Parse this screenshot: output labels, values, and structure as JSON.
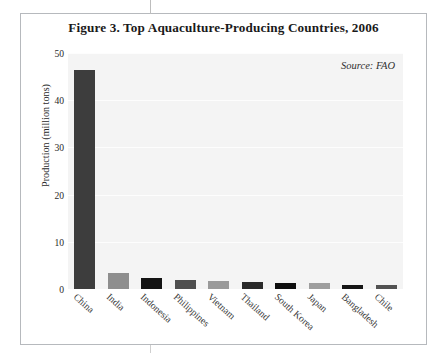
{
  "figure": {
    "title": "Figure 3. Top Aquaculture-Producing Countries, 2006",
    "source_note": "Source: FAO"
  },
  "chart_data": {
    "type": "bar",
    "title": "Figure 3. Top Aquaculture-Producing Countries, 2006",
    "xlabel": "",
    "ylabel": "Production (million tons)",
    "ylim": [
      0,
      50
    ],
    "yticks": [
      0,
      10,
      20,
      30,
      40,
      50
    ],
    "ytick_labels": [
      "0",
      "10",
      "20",
      "30",
      "40",
      "50"
    ],
    "grid": true,
    "legend": false,
    "annotations": [
      "Source: FAO"
    ],
    "categories": [
      "China",
      "India",
      "Indonesia",
      "Philippines",
      "Vietnam",
      "Thailand",
      "South Korea",
      "Japan",
      "Bangladesh",
      "Chile"
    ],
    "values": [
      46.5,
      3.4,
      2.3,
      2.0,
      1.7,
      1.4,
      1.3,
      1.2,
      0.9,
      0.8
    ],
    "bar_colors": [
      "#3d3d3d",
      "#8e8e8e",
      "#141414",
      "#4f4f4f",
      "#9a9a9a",
      "#2a2a2a",
      "#0f0f0f",
      "#9e9e9e",
      "#161616",
      "#525252"
    ],
    "plot_background": "#f4f4f4",
    "gridline_color": "#fdfdfd"
  }
}
